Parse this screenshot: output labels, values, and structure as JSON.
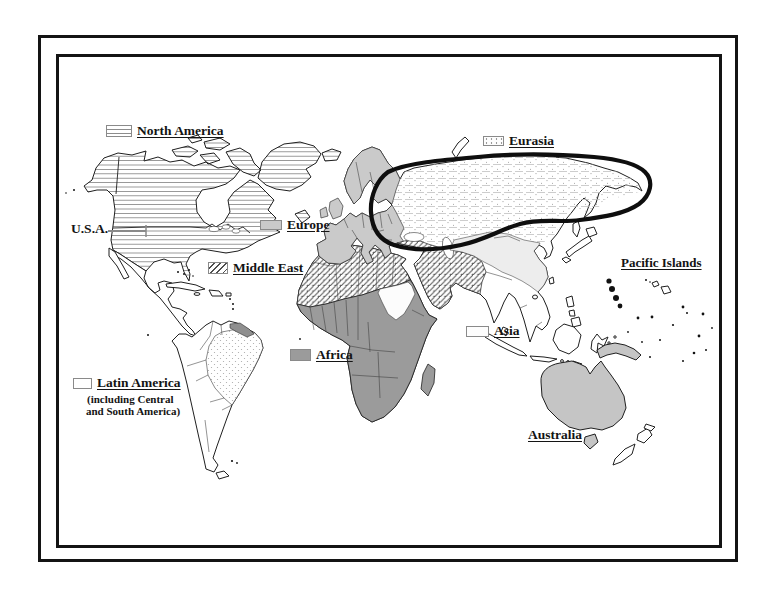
{
  "map": {
    "regions": {
      "north_america": {
        "label": "North America"
      },
      "usa": {
        "label": "U.S.A."
      },
      "europe": {
        "label": "Europe"
      },
      "middle_east": {
        "label": "Middle East"
      },
      "eurasia": {
        "label": "Eurasia"
      },
      "pacific_islands": {
        "label": "Pacific Islands"
      },
      "asia": {
        "label": "Asia"
      },
      "africa": {
        "label": "Africa"
      },
      "latin_america": {
        "label": "Latin America",
        "note_line1": "(including Central",
        "note_line2": "and South America)"
      },
      "australia": {
        "label": "Australia"
      }
    },
    "colors": {
      "frame": "#141414",
      "outline": "#1f1f1f",
      "europe_fill": "#cacaca",
      "africa_fill": "#9b9b9b",
      "australia_fill": "#c5c5c5",
      "guianas_fill": "#8f8f8f",
      "asia_fill": "#ededed",
      "hatch_line": "#8c8c8c",
      "eurasia_line": "#b8b8b8",
      "eurasia_dot": "#9a9a9a",
      "diag_line": "#4f4f4f",
      "stipple_dot": "#a8a8a8",
      "loop": "#0e0e0e",
      "label_text": "#141414",
      "leader_line": "#8a8a8a"
    }
  }
}
